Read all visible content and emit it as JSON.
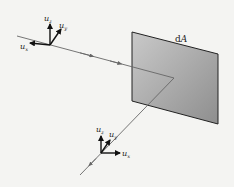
{
  "diagram": {
    "surface_label": "dA",
    "surface_label_d": "d",
    "surface_label_A": "A",
    "frames": [
      {
        "name": "incident-frame",
        "axes": [
          {
            "base": "u",
            "sub": "z"
          },
          {
            "base": "u",
            "sub": "y"
          },
          {
            "base": "u",
            "sub": "x"
          }
        ]
      },
      {
        "name": "reflected-frame",
        "axes": [
          {
            "base": "u",
            "sub": "z"
          },
          {
            "base": "u",
            "sub": "y"
          },
          {
            "base": "u",
            "sub": "x"
          }
        ]
      }
    ],
    "colors": {
      "background": "#f4f4f2",
      "plate_light": "#c8c8c8",
      "plate_dark": "#8a8a8a",
      "line": "#666666",
      "axis": "#111111"
    }
  }
}
